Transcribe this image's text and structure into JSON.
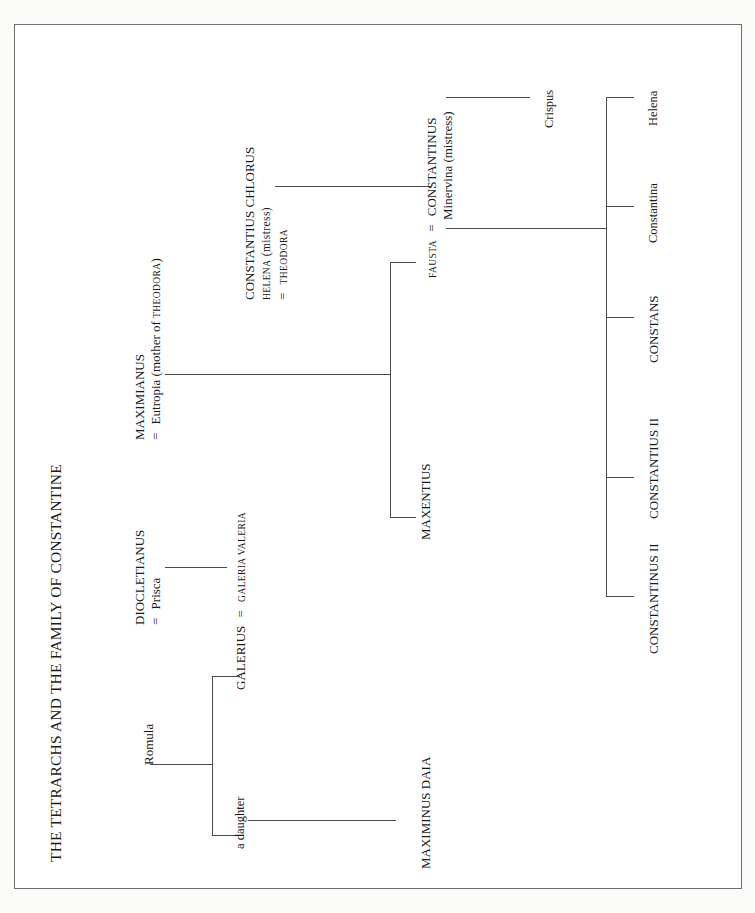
{
  "document": {
    "title": "THE TETRARCHS AND THE FAMILY OF CONSTANTINE",
    "type": "genealogical-chart",
    "orientation": "rotated-90-ccw",
    "border_color": "#6e6e6e",
    "line_color": "#4b4b4b",
    "background": "#ffffff"
  },
  "people": {
    "romula": "Romula",
    "galerius": "GALERIUS",
    "galerius_eq": "=",
    "galeria_valeria": "GALERIA VALERIA",
    "a_daughter": "a daughter",
    "diocletianus": "DIOCLETIANUS",
    "prisca_eq": "=",
    "prisca": "Prisca",
    "maximinus_daia": "MAXIMINUS DAIA",
    "maximianus": "MAXIMIANUS",
    "eutropia_eq": "=",
    "eutropia": "Eutropia (mother of THEODORA)",
    "eutropia_main": "Eutropia (mother of ",
    "eutropia_sc": "THEODORA",
    "eutropia_tail": ")",
    "constantius_chlorus": "CONSTANTIUS CHLORUS",
    "helena_mistress": "HELENA (mistress)",
    "helena_sc": "HELENA",
    "helena_tail": " (mistress)",
    "theodora_eq": "=",
    "theodora": "THEODORA",
    "maxentius": "MAXENTIUS",
    "fausta": "FAUSTA",
    "fausta_eq": "=",
    "constantinus": "CONSTANTINUS",
    "minervina": "Minervina (mistress)",
    "crispus": "Crispus",
    "helena_child": "Helena",
    "constantina": "Constantina",
    "constans": "CONSTANS",
    "constantius_ii": "CONSTANTIUS II",
    "constantinus_ii": "CONSTANTINUS II"
  },
  "relations": [
    {
      "parent": "Romula",
      "children": [
        "GALERIUS",
        "a daughter"
      ]
    },
    {
      "marriage": "GALERIUS = GALERIA VALERIA"
    },
    {
      "parent": "DIOCLETIANUS = Prisca",
      "children": [
        "GALERIA VALERIA"
      ]
    },
    {
      "parent": "a daughter",
      "children": [
        "MAXIMINUS DAIA"
      ]
    },
    {
      "marriage": "MAXIMIANUS = Eutropia (mother of THEODORA)"
    },
    {
      "parent": "MAXIMIANUS = Eutropia",
      "children": [
        "MAXENTIUS",
        "FAUSTA"
      ]
    },
    {
      "parent": "CONSTANTIUS CHLORUS + HELENA (mistress)",
      "children": [
        "CONSTANTINUS"
      ]
    },
    {
      "marriage": "CONSTANTIUS CHLORUS = THEODORA"
    },
    {
      "parent": "CONSTANTINUS + Minervina (mistress)",
      "children": [
        "Crispus"
      ]
    },
    {
      "parent": "FAUSTA = CONSTANTINUS",
      "children": [
        "Helena",
        "Constantina",
        "CONSTANS",
        "CONSTANTIUS II",
        "CONSTANTINUS II"
      ]
    }
  ]
}
